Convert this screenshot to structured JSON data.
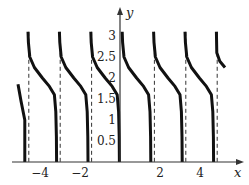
{
  "chart_data": {
    "type": "line",
    "title": "",
    "xlabel": "x",
    "ylabel": "y",
    "function_description": "periodic decreasing curve with period pi/2, ranging from about pi down to 0 within each period, vertical dashed asymptotes at jumps",
    "period": 1.5708,
    "x_ticks": [
      -4,
      -2,
      2,
      4
    ],
    "x_tick_labels": [
      "−4",
      "−2",
      "2",
      "4"
    ],
    "y_ticks": [
      0.5,
      1,
      1.5,
      2,
      2.5,
      3
    ],
    "y_tick_labels": [
      "0.5",
      "1",
      "1.5",
      "2",
      "2.5",
      "3"
    ],
    "xlim": [
      -5.4,
      6.0
    ],
    "ylim": [
      0,
      3.3
    ],
    "asymptotes_x": [
      -4.71,
      -3.14,
      -1.57,
      0,
      1.57,
      3.14,
      4.71
    ],
    "segment_shape": [
      [
        0.03,
        3.1
      ],
      [
        0.05,
        2.85
      ],
      [
        0.12,
        2.5
      ],
      [
        0.35,
        2.25
      ],
      [
        0.75,
        2.0
      ],
      [
        1.1,
        1.8
      ],
      [
        1.35,
        1.6
      ],
      [
        1.42,
        1.2
      ],
      [
        1.45,
        0.6
      ],
      [
        1.46,
        0.0
      ]
    ],
    "partial_left": {
      "from_x": -5.1,
      "from_y": 1.85,
      "to_x": -4.76,
      "to_y": 0
    },
    "partial_right": {
      "from_x": 4.74,
      "from_y": 3.1,
      "to_x": 5.25,
      "to_y": 2.25
    },
    "grid": false,
    "legend": null,
    "line_color": "#111111",
    "asymptote_color": "#333333"
  }
}
